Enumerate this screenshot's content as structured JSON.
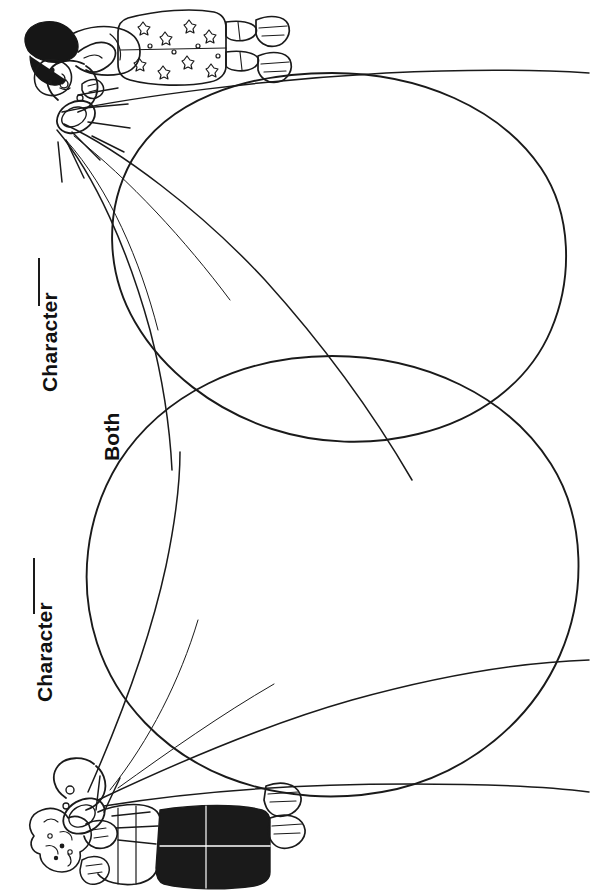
{
  "page": {
    "background_color": "#ffffff",
    "ink_color": "#1a1a1a",
    "width": 591,
    "height": 894,
    "orientation": "labels rotated 90 degrees counter-clockwise"
  },
  "labels": {
    "character_top": "Character",
    "both": "Both",
    "character_bottom": "Character"
  },
  "blanks": {
    "character_top_line": "",
    "character_bottom_line": ""
  },
  "diagram": {
    "type": "venn",
    "circle_count": 2,
    "circles": [
      {
        "name": "top-circle",
        "cx": 332,
        "cy": 256,
        "r": 184
      },
      {
        "name": "bottom-circle",
        "cx": 332,
        "cy": 575,
        "r": 220
      }
    ],
    "regions": [
      {
        "name": "top-only",
        "label": "Character"
      },
      {
        "name": "overlap",
        "label": "Both"
      },
      {
        "name": "bottom-only",
        "label": "Character"
      }
    ]
  },
  "illustrations": [
    {
      "name": "girl-with-flashlight",
      "description": "Line-art girl with black bob hair wearing a floral patterned dress and sneakers, holding a flashlight casting a wide beam",
      "position": "top-left corner",
      "rotation": "rotated 90 degrees"
    },
    {
      "name": "boy-with-flashlight",
      "description": "Line-art boy with curly hair wearing dark pants and sneakers, holding a flashlight casting a wide beam",
      "position": "bottom-left corner",
      "rotation": "rotated 90 degrees"
    }
  ]
}
